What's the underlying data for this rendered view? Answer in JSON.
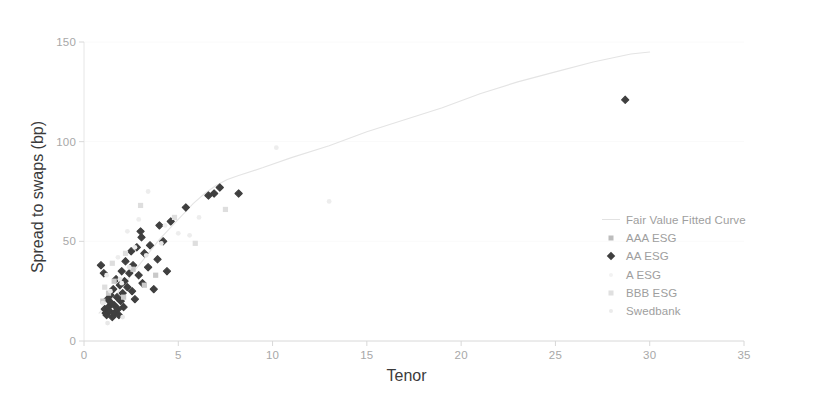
{
  "chart_data": {
    "type": "scatter",
    "title": "",
    "xlabel": "Tenor",
    "ylabel": "Spread to swaps  (bp)",
    "xlim": [
      0,
      35
    ],
    "ylim": [
      0,
      150
    ],
    "xticks": [
      0,
      5,
      10,
      15,
      20,
      25,
      30,
      35
    ],
    "yticks": [
      0,
      50,
      100,
      150
    ],
    "grid": "horizontal-faint",
    "legend_position": "center-right",
    "legend": [
      {
        "label": "Fair Value Fitted Curve",
        "marker": "line",
        "color": "#e2e2e2"
      },
      {
        "label": "AAA ESG",
        "marker": "square",
        "color": "#bdbdbd"
      },
      {
        "label": "AA ESG",
        "marker": "diamond",
        "color": "#3f3f3f"
      },
      {
        "label": "A ESG",
        "marker": "dot",
        "color": "#f2f2f2"
      },
      {
        "label": "BBB ESG",
        "marker": "square",
        "color": "#e0e0e0"
      },
      {
        "label": "Swedbank",
        "marker": "dot",
        "color": "#ebebeb"
      }
    ],
    "series": [
      {
        "name": "Fair Value Fitted Curve",
        "type": "line",
        "color": "#e4e4e4",
        "points": [
          [
            0.8,
            14
          ],
          [
            1.2,
            18
          ],
          [
            1.6,
            22
          ],
          [
            2.0,
            27
          ],
          [
            2.5,
            33
          ],
          [
            3.0,
            39
          ],
          [
            3.5,
            45
          ],
          [
            4.0,
            51
          ],
          [
            4.6,
            57
          ],
          [
            5.2,
            63
          ],
          [
            5.8,
            69
          ],
          [
            6.4,
            74
          ],
          [
            7.0,
            78
          ],
          [
            7.6,
            81
          ],
          [
            8.2,
            83
          ],
          [
            9.5,
            87
          ],
          [
            11.0,
            92
          ],
          [
            13.0,
            98
          ],
          [
            15.0,
            105
          ],
          [
            17.0,
            111
          ],
          [
            19.0,
            117
          ],
          [
            21.0,
            124
          ],
          [
            23.0,
            130
          ],
          [
            25.0,
            135
          ],
          [
            27.0,
            140
          ],
          [
            29.0,
            144
          ],
          [
            30.0,
            145
          ]
        ]
      },
      {
        "name": "AA ESG",
        "type": "scatter",
        "color": "#3f3f3f",
        "marker": "diamond",
        "points": [
          [
            0.9,
            38
          ],
          [
            1.05,
            34
          ],
          [
            1.1,
            16
          ],
          [
            1.15,
            14
          ],
          [
            1.2,
            13
          ],
          [
            1.25,
            21
          ],
          [
            1.3,
            17
          ],
          [
            1.35,
            15
          ],
          [
            1.4,
            23
          ],
          [
            1.45,
            19
          ],
          [
            1.5,
            12
          ],
          [
            1.55,
            26
          ],
          [
            1.6,
            18
          ],
          [
            1.62,
            14
          ],
          [
            1.7,
            31
          ],
          [
            1.75,
            22
          ],
          [
            1.8,
            16
          ],
          [
            1.85,
            13
          ],
          [
            1.9,
            28
          ],
          [
            1.95,
            20
          ],
          [
            2.0,
            35
          ],
          [
            2.05,
            24
          ],
          [
            2.1,
            17
          ],
          [
            2.15,
            30
          ],
          [
            2.2,
            40
          ],
          [
            2.3,
            27
          ],
          [
            2.4,
            34
          ],
          [
            2.5,
            45
          ],
          [
            2.55,
            25
          ],
          [
            2.6,
            38
          ],
          [
            2.7,
            21
          ],
          [
            2.8,
            47
          ],
          [
            2.9,
            33
          ],
          [
            3.0,
            55
          ],
          [
            3.05,
            52
          ],
          [
            3.1,
            29
          ],
          [
            3.2,
            44
          ],
          [
            3.4,
            37
          ],
          [
            3.5,
            48
          ],
          [
            3.7,
            26
          ],
          [
            3.9,
            41
          ],
          [
            4.0,
            58
          ],
          [
            4.2,
            50
          ],
          [
            4.4,
            35
          ],
          [
            4.6,
            60
          ],
          [
            5.4,
            67
          ],
          [
            6.6,
            73
          ],
          [
            6.9,
            74
          ],
          [
            7.2,
            77
          ],
          [
            8.2,
            74
          ],
          [
            28.7,
            121
          ]
        ]
      },
      {
        "name": "AAA ESG",
        "type": "scatter",
        "color": "#c9c9c9",
        "marker": "square",
        "points": [
          [
            1.0,
            20
          ],
          [
            1.3,
            24
          ],
          [
            1.6,
            30
          ],
          [
            2.1,
            22
          ],
          [
            2.6,
            36
          ],
          [
            3.2,
            28
          ],
          [
            3.8,
            33
          ]
        ]
      },
      {
        "name": "A ESG",
        "type": "scatter",
        "color": "#ededed",
        "marker": "dot",
        "points": [
          [
            1.2,
            33
          ],
          [
            1.8,
            42
          ],
          [
            2.3,
            55
          ],
          [
            2.9,
            61
          ],
          [
            3.4,
            75
          ],
          [
            4.3,
            58
          ],
          [
            5.0,
            54
          ],
          [
            5.6,
            53
          ],
          [
            6.1,
            62
          ],
          [
            10.2,
            97
          ],
          [
            13.0,
            70
          ],
          [
            2.0,
            29
          ],
          [
            2.7,
            47
          ]
        ]
      },
      {
        "name": "BBB ESG",
        "type": "scatter",
        "color": "#dedede",
        "marker": "square",
        "points": [
          [
            1.1,
            27
          ],
          [
            1.5,
            39
          ],
          [
            2.2,
            44
          ],
          [
            3.0,
            68
          ],
          [
            4.8,
            62
          ],
          [
            5.9,
            49
          ],
          [
            7.5,
            66
          ]
        ]
      },
      {
        "name": "Swedbank",
        "type": "scatter",
        "color": "#e8e8e8",
        "marker": "dot",
        "points": [
          [
            1.0,
            19
          ],
          [
            1.4,
            25
          ],
          [
            1.9,
            31
          ],
          [
            2.4,
            37
          ],
          [
            3.3,
            43
          ],
          [
            4.1,
            49
          ],
          [
            2.05,
            12
          ],
          [
            1.25,
            9
          ]
        ]
      }
    ]
  }
}
